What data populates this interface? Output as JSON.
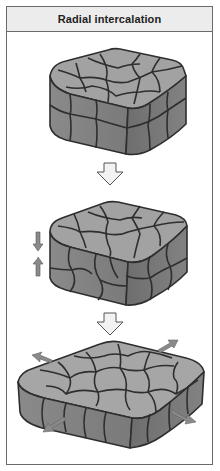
{
  "figure": {
    "title": "Radial intercalation",
    "stages": [
      {
        "name": "two-layer-tissue",
        "description": "Two stacked cell layers"
      },
      {
        "name": "intercalating-tissue",
        "description": "Cells from two layers interdigitate; vertical arrows indicate opposite movement"
      },
      {
        "name": "spread-single-layer",
        "description": "Single thinner layer that has expanded; outward arrows indicate spreading"
      }
    ],
    "colors": {
      "header_bg": "#ececec",
      "border": "#6a6a6a",
      "cell_top": "#9e9e9e",
      "cell_side": "#7c7c7c",
      "cell_outline": "#2e2e2e",
      "arrow_fill": "#f2f2f2",
      "motion_arrow": "#8a8a8a"
    }
  }
}
